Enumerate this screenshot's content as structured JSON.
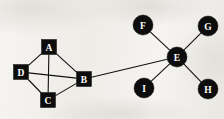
{
  "diagram": {
    "width": 224,
    "height": 119,
    "background_color": "#f1efeb",
    "node_color": "#0d0d0d",
    "node_label_color": "#ffffff",
    "edge_color": "#111111",
    "nodes": [
      {
        "id": "A",
        "label": "A",
        "shape": "square",
        "x": 49,
        "y": 47,
        "size": 15
      },
      {
        "id": "B",
        "label": "B",
        "shape": "square",
        "x": 84,
        "y": 79,
        "size": 15
      },
      {
        "id": "C",
        "label": "C",
        "shape": "square",
        "x": 48,
        "y": 100,
        "size": 15
      },
      {
        "id": "D",
        "label": "D",
        "shape": "square",
        "x": 21,
        "y": 72,
        "size": 15
      },
      {
        "id": "E",
        "label": "E",
        "shape": "circle",
        "x": 177,
        "y": 57,
        "size": 20
      },
      {
        "id": "F",
        "label": "F",
        "shape": "circle",
        "x": 143,
        "y": 25,
        "size": 20
      },
      {
        "id": "G",
        "label": "G",
        "shape": "circle",
        "x": 208,
        "y": 26,
        "size": 20
      },
      {
        "id": "H",
        "label": "H",
        "shape": "circle",
        "x": 208,
        "y": 89,
        "size": 20
      },
      {
        "id": "I",
        "label": "I",
        "shape": "circle",
        "x": 144,
        "y": 88,
        "size": 20
      }
    ],
    "edges": [
      {
        "from": "A",
        "to": "D"
      },
      {
        "from": "A",
        "to": "B"
      },
      {
        "from": "A",
        "to": "C"
      },
      {
        "from": "D",
        "to": "B"
      },
      {
        "from": "D",
        "to": "C"
      },
      {
        "from": "C",
        "to": "B"
      },
      {
        "from": "B",
        "to": "E"
      },
      {
        "from": "E",
        "to": "F"
      },
      {
        "from": "E",
        "to": "G"
      },
      {
        "from": "E",
        "to": "H"
      },
      {
        "from": "E",
        "to": "I"
      }
    ]
  }
}
